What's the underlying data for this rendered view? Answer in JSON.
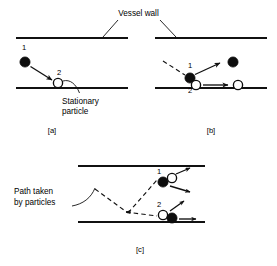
{
  "figure": {
    "annotations": {
      "vessel_wall": "Vessel wall",
      "stationary_particle_line1": "Stationary",
      "stationary_particle_line2": "particle",
      "path_taken_line1": "Path taken",
      "path_taken_line2": "by particles"
    },
    "colors": {
      "ink": "#111111",
      "particle_fill": "#0d0d0d",
      "particle_open_fill": "#ffffff",
      "background": "#ffffff"
    }
  },
  "panels": [
    {
      "id": "a",
      "label": "[a]",
      "caption_position": "below",
      "particles": [
        {
          "id": "1",
          "label": "1",
          "style": "filled",
          "cx": 25,
          "cy": 62,
          "r": 5.1
        },
        {
          "id": "2",
          "label": "2",
          "style": "open",
          "cx": 58,
          "cy": 83,
          "r": 4.6
        }
      ],
      "walls": [
        {
          "name": "top-wall",
          "x1": 16,
          "y1": 38,
          "x2": 128,
          "y2": 38
        },
        {
          "name": "bottom-wall",
          "x1": 16,
          "y1": 88,
          "x2": 128,
          "y2": 88
        }
      ]
    },
    {
      "id": "b",
      "label": "[b]",
      "caption_position": "below",
      "particles": [
        {
          "id": "1",
          "label": "1",
          "style": "filled",
          "cx": 190,
          "cy": 78,
          "r": 5.1
        },
        {
          "id": "2",
          "label": "2",
          "style": "open",
          "cx": 196,
          "cy": 85,
          "r": 4.6
        },
        {
          "id": "1-after",
          "label": "",
          "style": "filled",
          "cx": 233,
          "cy": 62,
          "r": 5.1
        },
        {
          "id": "2-after",
          "label": "",
          "style": "open",
          "cx": 238,
          "cy": 85,
          "r": 4.6
        }
      ],
      "walls": [
        {
          "name": "top-wall",
          "x1": 155,
          "y1": 38,
          "x2": 267,
          "y2": 38
        },
        {
          "name": "bottom-wall",
          "x1": 155,
          "y1": 88,
          "x2": 267,
          "y2": 88
        }
      ]
    },
    {
      "id": "c",
      "label": "[c]",
      "caption_position": "below",
      "particles": [
        {
          "id": "1",
          "label": "1",
          "style": "filled",
          "cx": 163,
          "cy": 182,
          "r": 5.1
        },
        {
          "id": "1-pair",
          "label": "",
          "style": "open",
          "cx": 172,
          "cy": 178,
          "r": 4.6
        },
        {
          "id": "2",
          "label": "2",
          "style": "open",
          "cx": 163,
          "cy": 215,
          "r": 4.6
        },
        {
          "id": "2-pair",
          "label": "",
          "style": "filled",
          "cx": 172,
          "cy": 218,
          "r": 5.1
        }
      ],
      "walls": [
        {
          "name": "top-wall",
          "x1": 78,
          "y1": 166,
          "x2": 205,
          "y2": 166
        },
        {
          "name": "bottom-wall",
          "x1": 78,
          "y1": 222,
          "x2": 205,
          "y2": 222
        }
      ]
    }
  ]
}
